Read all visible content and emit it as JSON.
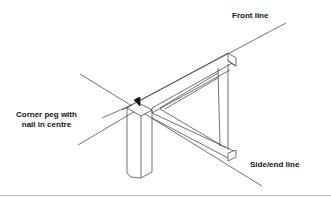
{
  "diagram": {
    "labels": {
      "front_line": "Front line",
      "side_end_line": "Side/end line",
      "corner_peg_line1": "Corner peg with",
      "corner_peg_line2": "nail in centre"
    },
    "colors": {
      "stroke": "#333333",
      "text": "#111111",
      "divider": "#b8b8b8"
    }
  }
}
